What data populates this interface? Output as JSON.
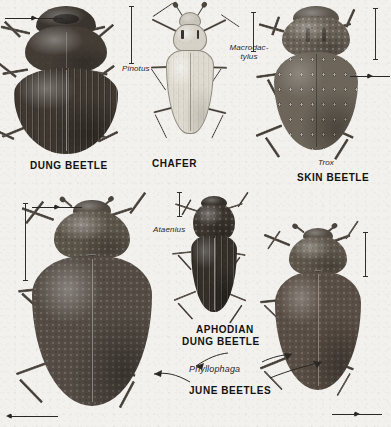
{
  "plate": {
    "title": "Scarab beetle identification plate",
    "background_color": "#f3f1ee",
    "ink_color": "#171614"
  },
  "specimens": [
    {
      "id": "dung-beetle",
      "common_name": "DUNG BEETLE",
      "genus": "Pinotus",
      "position": "top-left",
      "description": "Large broad black scarab with strongly striate elytra and broad pronotum"
    },
    {
      "id": "chafer",
      "common_name": "CHAFER",
      "genus": "Macrodac-",
      "genus_line2": "tylus",
      "genus_full": "Macrodactylus",
      "position": "top-center",
      "description": "Slender pale elongate beetle with very long thin legs"
    },
    {
      "id": "skin-beetle",
      "common_name": "SKIN BEETLE",
      "genus": "Trox",
      "position": "top-right",
      "description": "Rough warty beetle with rows of raised tubercles on elytra"
    },
    {
      "id": "june-beetle-left",
      "common_name": "JUNE BEETLES",
      "genus": "Phyllophaga",
      "position": "bottom-left",
      "description": "Large robust oval brown scarab"
    },
    {
      "id": "aphodian-dung-beetle",
      "common_name_line1": "APHODIAN",
      "common_name_line2": "DUNG BEETLE",
      "common_name": "APHODIAN DUNG BEETLE",
      "genus": "Ataenius",
      "position": "bottom-center",
      "description": "Small elongate dark beetle with deeply striate elytra"
    },
    {
      "id": "june-beetle-right",
      "common_name": "JUNE BEETLES",
      "genus": "Phyllophaga",
      "position": "bottom-right",
      "description": "Robust oval brown scarab, second June beetle"
    }
  ],
  "labels": {
    "dung_beetle": "DUNG BEETLE",
    "pinotus": "Pinotus",
    "chafer": "CHAFER",
    "macrodactylus_l1": "Macrodac-",
    "macrodactylus_l2": "tylus",
    "skin_beetle": "SKIN BEETLE",
    "trox": "Trox",
    "ataenius": "Ataenius",
    "aphodian_l1": "APHODIAN",
    "aphodian_l2": "DUNG BEETLE",
    "phyllophaga": "Phyllophaga",
    "june_beetles": "JUNE BEETLES"
  },
  "scale_bars": [
    {
      "id": "scale-dung-beetle",
      "x": 128,
      "y": 6,
      "height": 58
    },
    {
      "id": "scale-chafer",
      "x": 250,
      "y": 12,
      "height": 40
    },
    {
      "id": "scale-skin-beetle",
      "x": 372,
      "y": 8,
      "height": 52
    },
    {
      "id": "scale-aphodian",
      "x": 176,
      "y": 192,
      "height": 25
    },
    {
      "id": "scale-june-left",
      "x": 22,
      "y": 203,
      "height": 78
    },
    {
      "id": "scale-june-right",
      "x": 362,
      "y": 232,
      "height": 45
    }
  ],
  "pointer_arrows": [
    {
      "id": "arrow-dung-head",
      "direction": "right",
      "x": 5,
      "y": 14,
      "width": 58
    },
    {
      "id": "arrow-june-left-head",
      "direction": "right",
      "x": 32,
      "y": 203,
      "width": 50
    },
    {
      "id": "arrow-june-left-tarsus",
      "direction": "left",
      "x": 10,
      "y": 412,
      "width": 48
    },
    {
      "id": "arrow-june-right-leg",
      "direction": "right",
      "x": 332,
      "y": 410,
      "width": 50
    },
    {
      "id": "arrow-skin-right-leg",
      "direction": "right",
      "x": 350,
      "y": 72,
      "width": 40
    }
  ]
}
